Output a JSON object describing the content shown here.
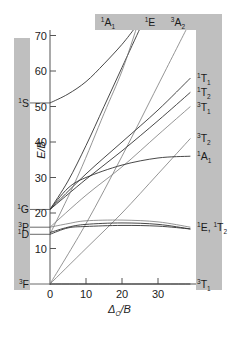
{
  "figure": {
    "type": "Tanabe-Sugano diagram (d8 octahedral)",
    "colors": {
      "band_gray": "#bfbfbf",
      "line_dark": "#333333",
      "line_light": "#7a7a7a",
      "axis": "#555555"
    }
  },
  "axes": {
    "y_title": "E/B",
    "x_title_main": "Δ",
    "x_title_sub": "O",
    "x_title_tail": "/B",
    "y_ticks": [
      10,
      20,
      30,
      40,
      50,
      60,
      70
    ],
    "x_ticks": [
      0,
      10,
      20,
      30
    ],
    "xlim": [
      0,
      40
    ],
    "ylim": [
      0,
      72
    ]
  },
  "free_ion_terms": [
    {
      "sup": "1",
      "main": "S",
      "y": 51
    },
    {
      "sup": "1",
      "main": "G",
      "y": 21
    },
    {
      "sup": "3",
      "main": "P",
      "y": 16
    },
    {
      "sup": "1",
      "main": "D",
      "y": 14
    },
    {
      "sup": "3",
      "main": "F",
      "y": 0
    }
  ],
  "top_labels": [
    {
      "sup": "1",
      "main": "A",
      "sub": "1"
    },
    {
      "sup": "1",
      "main": "E",
      "sub": ""
    },
    {
      "sup": "3",
      "main": "A",
      "sub": "2"
    }
  ],
  "right_labels": [
    {
      "sup": "1",
      "main": "T",
      "sub": "1",
      "y": 58
    },
    {
      "sup": "1",
      "main": "T",
      "sub": "2",
      "y": 54
    },
    {
      "sup": "3",
      "main": "T",
      "sub": "1",
      "y": 50
    },
    {
      "sup": "3",
      "main": "T",
      "sub": "2",
      "y": 41
    },
    {
      "sup": "1",
      "main": "A",
      "sub": "1",
      "y": 36
    },
    {
      "sup": "1",
      "main": "E, ",
      "sub": "",
      "extra_sup": "1",
      "extra_main": "T",
      "extra_sub": "2",
      "y": 16
    },
    {
      "sup": "3",
      "main": "T",
      "sub": "1",
      "y": 0
    }
  ],
  "chart_data": {
    "type": "line",
    "title": "",
    "xlabel": "Δo/B",
    "ylabel": "E/B",
    "xlim": [
      0,
      40
    ],
    "ylim": [
      0,
      72
    ],
    "grid": false,
    "series": [
      {
        "name": "1A1 (from 1S)",
        "style": "dark",
        "points": [
          [
            0,
            51
          ],
          [
            5,
            53.5
          ],
          [
            10,
            57
          ],
          [
            15,
            62
          ],
          [
            20,
            67.5
          ],
          [
            23.5,
            72
          ]
        ]
      },
      {
        "name": "1E (top)",
        "style": "dark",
        "points": [
          [
            0,
            21
          ],
          [
            5,
            29
          ],
          [
            10,
            39
          ],
          [
            15,
            50
          ],
          [
            20,
            61
          ],
          [
            25,
            72
          ]
        ]
      },
      {
        "name": "3A2",
        "style": "light",
        "points": [
          [
            0,
            0
          ],
          [
            10,
            17
          ],
          [
            20,
            36
          ],
          [
            30,
            56
          ],
          [
            38,
            72
          ]
        ]
      },
      {
        "name": "1T1",
        "style": "dark",
        "points": [
          [
            0,
            21
          ],
          [
            10,
            31
          ],
          [
            20,
            40
          ],
          [
            30,
            49
          ],
          [
            39,
            58
          ]
        ]
      },
      {
        "name": "1T2",
        "style": "dark",
        "points": [
          [
            0,
            21
          ],
          [
            10,
            29.5
          ],
          [
            20,
            37.5
          ],
          [
            30,
            46
          ],
          [
            39,
            54
          ]
        ]
      },
      {
        "name": "3T1 (upper)",
        "style": "light",
        "points": [
          [
            0,
            16
          ],
          [
            10,
            25
          ],
          [
            20,
            33
          ],
          [
            30,
            42
          ],
          [
            39,
            50
          ]
        ]
      },
      {
        "name": "1T2 (via 1D)",
        "style": "light",
        "points": [
          [
            0,
            14
          ],
          [
            8,
            31
          ],
          [
            15,
            48
          ],
          [
            20,
            60
          ],
          [
            24,
            72
          ]
        ]
      },
      {
        "name": "3T2",
        "style": "light",
        "points": [
          [
            0,
            0
          ],
          [
            10,
            10
          ],
          [
            20,
            20
          ],
          [
            30,
            31
          ],
          [
            39,
            41
          ]
        ]
      },
      {
        "name": "1A1 (from 1G)",
        "style": "dark",
        "points": [
          [
            0,
            21
          ],
          [
            5,
            27
          ],
          [
            10,
            30
          ],
          [
            20,
            33.5
          ],
          [
            30,
            35.5
          ],
          [
            39,
            36
          ]
        ]
      },
      {
        "name": "1E",
        "style": "dark",
        "points": [
          [
            0,
            14.5
          ],
          [
            5,
            16
          ],
          [
            10,
            16.8
          ],
          [
            20,
            17.2
          ],
          [
            30,
            16.8
          ],
          [
            39,
            15.5
          ]
        ]
      },
      {
        "name": "1T2 (flat)",
        "style": "dark",
        "points": [
          [
            0,
            14
          ],
          [
            5,
            15.8
          ],
          [
            10,
            16.2
          ],
          [
            20,
            16.5
          ],
          [
            30,
            16.3
          ],
          [
            39,
            15.5
          ]
        ]
      },
      {
        "name": "3T1 (from 3P)",
        "style": "light",
        "points": [
          [
            0,
            16
          ],
          [
            5,
            17
          ],
          [
            10,
            17.8
          ],
          [
            20,
            18
          ],
          [
            30,
            17.5
          ],
          [
            39,
            16
          ]
        ]
      },
      {
        "name": "3T1 (ground)",
        "style": "dark",
        "points": [
          [
            0,
            0
          ],
          [
            39,
            0
          ]
        ]
      }
    ]
  }
}
